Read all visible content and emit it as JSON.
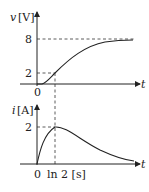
{
  "top_graph": {
    "y_label_var": "v",
    "y_label_unit": "[V]",
    "x_label": "t",
    "origin_label": "0",
    "y_ticks": [
      "8",
      "2"
    ],
    "curve": "voltage rises from 0 toward asymptote 8, passing 2 at t = ln 2"
  },
  "bottom_graph": {
    "y_label_var": "i",
    "y_label_unit": "[A]",
    "x_label": "t",
    "origin_label": "0",
    "y_ticks": [
      "2"
    ],
    "x_tick_label": "ln 2 [s]",
    "curve": "current rises from 0 to peak 2 at t = ln 2, then decays toward 0"
  },
  "colors": {
    "line": "#222222",
    "background": "#ffffff"
  }
}
